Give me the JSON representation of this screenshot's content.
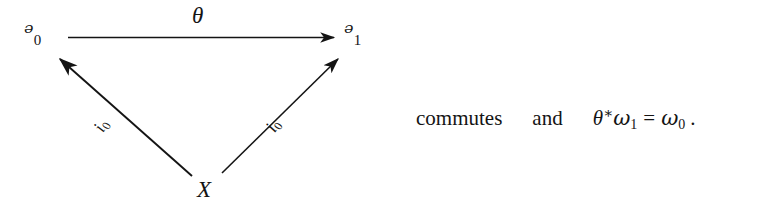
{
  "figure": {
    "kind": "commutative-triangle-diagram",
    "background_color": "#ffffff",
    "ink_color": "#141414"
  },
  "diagram": {
    "nodes": [
      {
        "id": "u0",
        "base": "ᵊ",
        "subscript": "0",
        "label": "ᵊ₀"
      },
      {
        "id": "u1",
        "base": "ᵊ",
        "subscript": "1",
        "label": "ᵊ₁"
      },
      {
        "id": "x",
        "base": "X",
        "subscript": "",
        "label": "X"
      }
    ],
    "edges": [
      {
        "id": "theta",
        "from": "u0",
        "to": "u1",
        "label_base": "θ",
        "label_sub": ""
      },
      {
        "id": "i0-left",
        "from": "x",
        "to": "u0",
        "label_base": "i",
        "label_sub": "0"
      },
      {
        "id": "i0-right",
        "from": "x",
        "to": "u1",
        "label_base": "i",
        "label_sub": "0"
      }
    ]
  },
  "prose": {
    "commutes": "commutes",
    "and": "and",
    "equation": {
      "theta": "θ",
      "star": "∗",
      "omega_left": "ω",
      "omega_left_sub": "1",
      "equals": "=",
      "omega_right": "ω",
      "omega_right_sub": "0",
      "period": ".",
      "plain": "θ*ω₁ = ω₀ ."
    }
  }
}
